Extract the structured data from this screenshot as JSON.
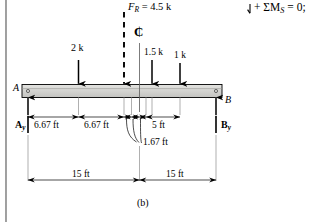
{
  "figure": {
    "caption": "(b)",
    "beam": {
      "left_support_label": "A",
      "right_support_label": "B",
      "fill_color": "#d5d5d2",
      "edge_color": "#000000"
    },
    "equation": {
      "text": "+ ΣM",
      "subscript": "S",
      "tail": " = 0;",
      "sense_icon": "counterclockwise-moment-arrow"
    },
    "resultant": {
      "label": "F",
      "subscript": "R",
      "value": " = 4.5 k",
      "style": "dashed"
    },
    "centerline_symbol": "₵",
    "loads": [
      {
        "label": "2 k",
        "value": 2,
        "unit": "k",
        "x_ft": 6.67
      },
      {
        "label": "1.5 k",
        "value": 1.5,
        "unit": "k",
        "x_ft": 15.0
      },
      {
        "label": "1 k",
        "value": 1,
        "unit": "k",
        "x_ft": 18.33
      }
    ],
    "reactions": [
      {
        "label": "A",
        "subscript": "y",
        "side": "left"
      },
      {
        "label": "B",
        "subscript": "y",
        "side": "right"
      }
    ],
    "dimensions_upper": [
      {
        "label": "6.67 ft",
        "value": 6.67,
        "unit": "ft"
      },
      {
        "label": "6.67 ft",
        "value": 6.67,
        "unit": "ft"
      },
      {
        "label": "5 ft",
        "value": 5,
        "unit": "ft"
      }
    ],
    "dimension_leader": {
      "label": "1.67 ft",
      "value": 1.67,
      "unit": "ft",
      "count": 3
    },
    "dimensions_lower": [
      {
        "label": "15 ft",
        "value": 15,
        "unit": "ft"
      },
      {
        "label": "15 ft",
        "value": 15,
        "unit": "ft"
      }
    ]
  }
}
